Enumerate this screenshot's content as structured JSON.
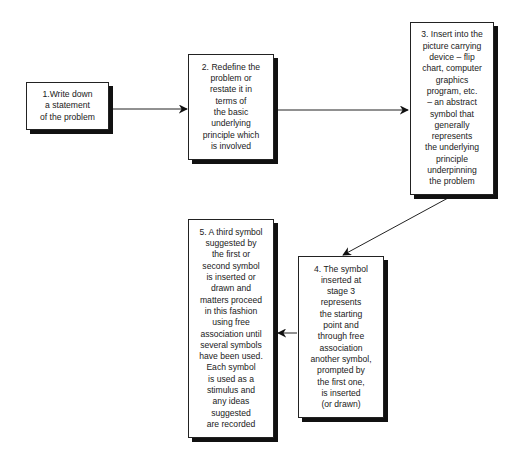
{
  "diagram": {
    "type": "flowchart",
    "steps": [
      {
        "id": 1,
        "text": "1.Write down\na statement\nof the problem"
      },
      {
        "id": 2,
        "text": "2. Redefine the\nproblem or\nrestate it in\nterms of\nthe basic\nunderlying\nprinciple which\nis involved"
      },
      {
        "id": 3,
        "text": "3. Insert into the\npicture carrying\ndevice – flip\nchart, computer\ngraphics\nprogram, etc.\n– an abstract\nsymbol that\ngenerally\nrepresents\nthe underlying\nprinciple\nunderpinning\nthe problem"
      },
      {
        "id": 4,
        "text": "4. The symbol\ninserted at\nstage 3\nrepresents\nthe starting\npoint and\nthrough free\nassociation\nanother symbol,\nprompted by\nthe first one,\nis inserted\n(or drawn)"
      },
      {
        "id": 5,
        "text": "5. A third symbol\nsuggested by\nthe first or\nsecond symbol\nis inserted or\ndrawn and\nmatters proceed\nin this fashion\nusing free\nassociation until\nseveral symbols\nhave been used.\nEach symbol\nis used as a\nstimulus and\nany ideas\nsuggested\nare recorded"
      }
    ],
    "connections": [
      {
        "from": 1,
        "to": 2
      },
      {
        "from": 2,
        "to": 3
      },
      {
        "from": 3,
        "to": 4
      },
      {
        "from": 4,
        "to": 5
      }
    ]
  }
}
